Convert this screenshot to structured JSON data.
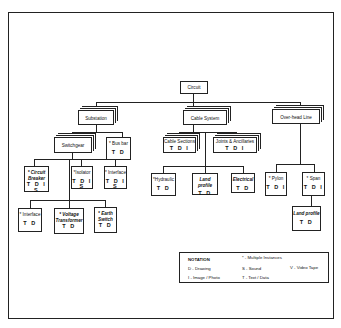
{
  "diagram": {
    "root": {
      "label": "Circuit"
    },
    "level1": [
      {
        "label": "Substation"
      },
      {
        "label": "Cable System"
      },
      {
        "label": "Over-head Line"
      }
    ],
    "substation_children": [
      {
        "label": "Switchgear"
      },
      {
        "label": "* Bus bar",
        "codes": "T D"
      }
    ],
    "switchgear_children": [
      {
        "label": "* Circuit Breaker",
        "codes": "T D I S"
      },
      {
        "label": "*Isolator",
        "codes": "T D I S"
      },
      {
        "label": "* Interface",
        "codes": "T D I S"
      }
    ],
    "breaker_children": [
      {
        "label": "* Interface",
        "codes": "T D"
      },
      {
        "label": "* Voltage Transformer",
        "codes": "T D"
      },
      {
        "label": "* Earth Switch",
        "codes": "T D"
      }
    ],
    "cable_children": [
      {
        "label": "Cable Sections",
        "codes": "T D I"
      },
      {
        "label": "Joints & Ancillaries",
        "codes": "T D I"
      }
    ],
    "cable_section_children": [
      {
        "label": "*Hydraulic",
        "codes": "T D"
      },
      {
        "label": "Land profile",
        "codes": "T D"
      },
      {
        "label": "Electrical",
        "codes": "T D"
      }
    ],
    "overhead_children": [
      {
        "label": "* Pylon",
        "codes": "T D I"
      },
      {
        "label": "* Span",
        "codes": "T D I"
      }
    ],
    "span_children": [
      {
        "label": "Land profile",
        "codes": "T D"
      }
    ]
  },
  "legend": {
    "title": "NOTATION",
    "items": [
      "* - Multiple Instances",
      "D - Drawing",
      "S - Sound",
      "V - Video Tape",
      "I - Image / Photo",
      "T - Text / Data"
    ]
  }
}
